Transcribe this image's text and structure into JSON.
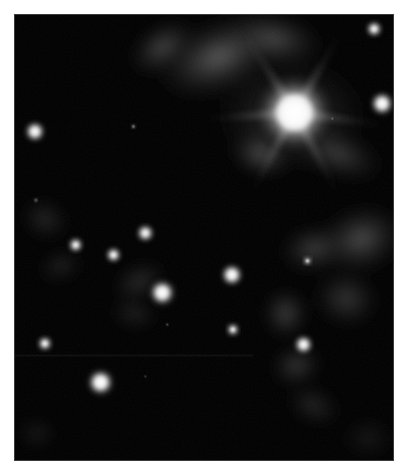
{
  "figure": {
    "kind": "astronomical-image",
    "colorspace": "grayscale",
    "background_color": "#ffffff",
    "sky_color": "#000000",
    "frame_border_color": "#3a3a3a",
    "frame": {
      "x": 14,
      "y": 14,
      "width": 380,
      "height": 447
    }
  },
  "sky": {
    "width": 380,
    "height": 447,
    "stars": [
      {
        "name": "bright-primary-star",
        "x": 281,
        "y": 98,
        "radius": 44,
        "core_radius": 17,
        "brightness": 1.0,
        "spikes": true
      },
      {
        "name": "star-right-upper",
        "x": 361,
        "y": 14,
        "radius": 11,
        "core_radius": 4.5,
        "brightness": 0.92,
        "spikes": false
      },
      {
        "name": "star-right-mid",
        "x": 369,
        "y": 89,
        "radius": 16,
        "core_radius": 7,
        "brightness": 0.97,
        "spikes": false
      },
      {
        "name": "star-left-upper",
        "x": 20,
        "y": 117,
        "radius": 14,
        "core_radius": 6,
        "brightness": 0.95,
        "spikes": false
      },
      {
        "name": "star-faint-upper-mid",
        "x": 119,
        "y": 112,
        "radius": 4,
        "core_radius": 1.3,
        "brightness": 0.55,
        "spikes": false
      },
      {
        "name": "star-mid-left-a",
        "x": 61,
        "y": 231,
        "radius": 10,
        "core_radius": 4.2,
        "brightness": 0.92,
        "spikes": false
      },
      {
        "name": "star-mid-left-b",
        "x": 99,
        "y": 241,
        "radius": 10.5,
        "core_radius": 4.4,
        "brightness": 0.93,
        "spikes": false
      },
      {
        "name": "star-mid-upper-center",
        "x": 131,
        "y": 219,
        "radius": 12,
        "core_radius": 5.2,
        "brightness": 0.9,
        "spikes": false
      },
      {
        "name": "star-center-bright",
        "x": 148,
        "y": 279,
        "radius": 19,
        "core_radius": 7.5,
        "brightness": 1.0,
        "spikes": false
      },
      {
        "name": "star-center-right",
        "x": 218,
        "y": 261,
        "radius": 15,
        "core_radius": 6.5,
        "brightness": 0.98,
        "spikes": false
      },
      {
        "name": "star-lower-center",
        "x": 219,
        "y": 316,
        "radius": 8.5,
        "core_radius": 3.6,
        "brightness": 0.9,
        "spikes": false
      },
      {
        "name": "star-nebula-embedded",
        "x": 290,
        "y": 331,
        "radius": 13,
        "core_radius": 5.5,
        "brightness": 0.96,
        "spikes": false
      },
      {
        "name": "star-nebula-small",
        "x": 294,
        "y": 247,
        "radius": 6,
        "core_radius": 2.4,
        "brightness": 0.85,
        "spikes": false
      },
      {
        "name": "star-left-lower",
        "x": 30,
        "y": 330,
        "radius": 10,
        "core_radius": 4.2,
        "brightness": 0.93,
        "spikes": false
      },
      {
        "name": "star-bottom-bright",
        "x": 86,
        "y": 369,
        "radius": 19,
        "core_radius": 7.8,
        "brightness": 1.0,
        "spikes": false
      },
      {
        "name": "star-speck-a",
        "x": 153,
        "y": 311,
        "radius": 2.5,
        "core_radius": 0.8,
        "brightness": 0.45,
        "spikes": false
      },
      {
        "name": "star-speck-b",
        "x": 131,
        "y": 363,
        "radius": 2.2,
        "core_radius": 0.7,
        "brightness": 0.4,
        "spikes": false
      },
      {
        "name": "star-speck-c",
        "x": 319,
        "y": 104,
        "radius": 2.5,
        "core_radius": 0.8,
        "brightness": 0.4,
        "spikes": false
      },
      {
        "name": "star-speck-d",
        "x": 21,
        "y": 186,
        "radius": 4,
        "core_radius": 1.2,
        "brightness": 0.38,
        "spikes": false
      }
    ],
    "nebulosity": [
      {
        "name": "nebula-top-arc",
        "cx": 205,
        "cy": 42,
        "rx": 78,
        "ry": 44,
        "rot": -22,
        "opacity": 0.5
      },
      {
        "name": "nebula-top-left-wisp",
        "cx": 148,
        "cy": 32,
        "rx": 44,
        "ry": 26,
        "rot": -35,
        "opacity": 0.4
      },
      {
        "name": "nebula-top-right-glow",
        "cx": 262,
        "cy": 24,
        "rx": 58,
        "ry": 32,
        "rot": 12,
        "opacity": 0.38
      },
      {
        "name": "nebula-around-primary",
        "cx": 278,
        "cy": 100,
        "rx": 92,
        "ry": 70,
        "rot": 0,
        "opacity": 0.3
      },
      {
        "name": "nebula-below-primary",
        "cx": 247,
        "cy": 140,
        "rx": 36,
        "ry": 26,
        "rot": 18,
        "opacity": 0.42
      },
      {
        "name": "nebula-lower-right-of-primary",
        "cx": 325,
        "cy": 140,
        "rx": 56,
        "ry": 28,
        "rot": 20,
        "opacity": 0.33
      },
      {
        "name": "nebula-right-bank",
        "cx": 348,
        "cy": 225,
        "rx": 52,
        "ry": 40,
        "rot": -18,
        "opacity": 0.42
      },
      {
        "name": "nebula-right-mid",
        "cx": 300,
        "cy": 235,
        "rx": 40,
        "ry": 28,
        "rot": -10,
        "opacity": 0.35
      },
      {
        "name": "nebula-right-lower",
        "cx": 333,
        "cy": 285,
        "rx": 40,
        "ry": 34,
        "rot": 15,
        "opacity": 0.3
      },
      {
        "name": "nebula-clump-center-right",
        "cx": 272,
        "cy": 300,
        "rx": 26,
        "ry": 30,
        "rot": 0,
        "opacity": 0.38
      },
      {
        "name": "nebula-clump-lower",
        "cx": 283,
        "cy": 352,
        "rx": 30,
        "ry": 24,
        "rot": -15,
        "opacity": 0.33
      },
      {
        "name": "nebula-tail-bottom",
        "cx": 300,
        "cy": 392,
        "rx": 34,
        "ry": 22,
        "rot": 25,
        "opacity": 0.22
      },
      {
        "name": "nebula-left-wisp-a",
        "cx": 30,
        "cy": 205,
        "rx": 30,
        "ry": 24,
        "rot": 30,
        "opacity": 0.22
      },
      {
        "name": "nebula-left-wisp-b",
        "cx": 46,
        "cy": 252,
        "rx": 28,
        "ry": 18,
        "rot": -20,
        "opacity": 0.2
      },
      {
        "name": "nebula-center-wisp",
        "cx": 125,
        "cy": 268,
        "rx": 34,
        "ry": 22,
        "rot": -25,
        "opacity": 0.26
      },
      {
        "name": "nebula-center-low",
        "cx": 120,
        "cy": 300,
        "rx": 30,
        "ry": 18,
        "rot": 10,
        "opacity": 0.2
      },
      {
        "name": "nebula-bottom-left-faint",
        "cx": 22,
        "cy": 420,
        "rx": 22,
        "ry": 18,
        "rot": 0,
        "opacity": 0.16
      },
      {
        "name": "nebula-bottom-right-faint",
        "cx": 355,
        "cy": 425,
        "rx": 34,
        "ry": 26,
        "rot": 0,
        "opacity": 0.12
      }
    ],
    "artifacts": [
      {
        "name": "horizontal-seam-line",
        "x1": 0,
        "y1": 342,
        "x2": 240,
        "y2": 342,
        "opacity": 0.16
      }
    ],
    "diffraction_spikes": {
      "name": "primary-star-spikes",
      "center_x": 281,
      "center_y": 98,
      "angles_deg": [
        8,
        62,
        118,
        176,
        238,
        300
      ],
      "length": 110
    }
  }
}
